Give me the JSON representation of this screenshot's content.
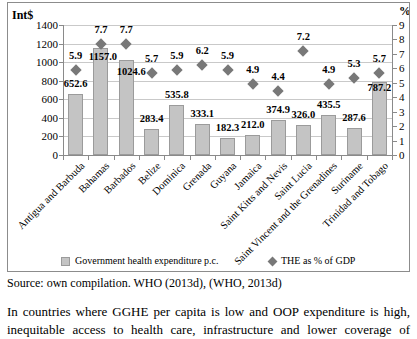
{
  "page": {
    "source_line": "Source: own compilation. WHO (2013d), (WHO, 2013d)",
    "body_lines": [
      "In countries where GGHE per capita is low and OOP expenditure is high,",
      "inequitable access to health care, infrastructure and lower coverage of"
    ]
  },
  "chart_data": {
    "type": "bar",
    "subtype": "bar-with-scatter-overlay",
    "categories": [
      "Antigua and Barbuda",
      "Bahamas",
      "Barbados",
      "Belize",
      "Dominica",
      "Grenada",
      "Guyana",
      "Jamaica",
      "Saint Kitts and Nevis",
      "Saint Lucia",
      "Saint Vincent and the Grenadines",
      "Suriname",
      "Trinidad and Tobago"
    ],
    "series": [
      {
        "name": "Government health expenditure p.c.",
        "type": "bar",
        "axis": "left",
        "values": [
          652.6,
          1157.0,
          1024.6,
          283.4,
          535.8,
          333.1,
          182.3,
          212.0,
          374.9,
          326.0,
          435.5,
          287.6,
          787.2
        ],
        "labels": [
          "652.6",
          "1157.0",
          "1024.6",
          "283.4",
          "535.8",
          "333.1",
          "182.3",
          "212.0",
          "374.9",
          "326.0",
          "435.5",
          "287.6",
          "787.2"
        ]
      },
      {
        "name": "THE as % of GDP",
        "type": "scatter-diamond",
        "axis": "right",
        "values": [
          5.9,
          7.7,
          7.7,
          5.7,
          5.9,
          6.2,
          5.9,
          4.9,
          4.4,
          7.2,
          4.9,
          5.3,
          5.7
        ],
        "labels": [
          "5.9",
          "7.7",
          "7.7",
          "5.7",
          "5.9",
          "6.2",
          "5.9",
          "4.9",
          "4.4",
          "7.2",
          "4.9",
          "5.3",
          "5.7"
        ]
      }
    ],
    "left_axis": {
      "title": "Int$",
      "min": 0,
      "max": 1400,
      "step": 200,
      "ticks": [
        "0",
        "200",
        "400",
        "600",
        "800",
        "1000",
        "1200",
        "1400"
      ]
    },
    "right_axis": {
      "title": "%",
      "min": 0,
      "max": 9,
      "step": 1,
      "ticks": [
        "0",
        "1",
        "2",
        "3",
        "4",
        "5",
        "6",
        "7",
        "8",
        "9"
      ]
    },
    "grid": "horizontal",
    "legend_position": "bottom",
    "colors": {
      "bar_fill": "#c4c4c4",
      "bar_border": "#9b9b9b",
      "diamond": "#787878",
      "gridline": "#c9c9c9",
      "axis_line": "#8a8a8a",
      "label_text": "#000000"
    },
    "bar_label_offsets": {
      "1": [
        2,
        19
      ],
      "2": [
        5,
        22
      ],
      "12": [
        0,
        16
      ]
    }
  }
}
